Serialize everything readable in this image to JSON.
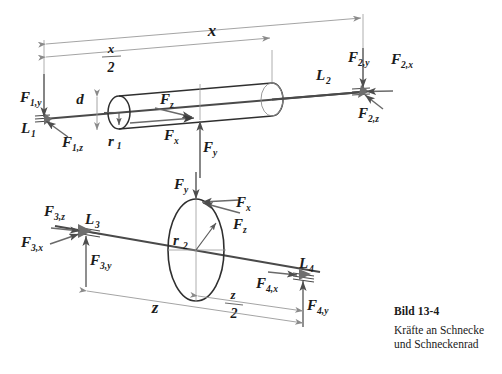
{
  "figure": {
    "caption_number": "Bild 13-4",
    "caption_line1": "Kräfte an Schnecke",
    "caption_line2": "und Schneckenrad",
    "stroke_color": "#555555",
    "outline_color": "#333333",
    "dim_color": "#8a8a8a",
    "text_color": "#1b1b1b",
    "background": "#ffffff"
  },
  "worm_shaft": {
    "name": "Schnecke",
    "dimensions": {
      "total_label": "x",
      "half_label_numerator": "x",
      "half_label_denominator": "2",
      "diameter_label": "d",
      "radius_label": "r",
      "radius_sub": "1"
    },
    "bearing_left": {
      "label": "L",
      "label_sub": "1",
      "forces": [
        {
          "label": "F",
          "sub": "1,y"
        },
        {
          "label": "F",
          "sub": "1,z"
        }
      ]
    },
    "bearing_right": {
      "label": "L",
      "label_sub": "2",
      "forces": [
        {
          "label": "F",
          "sub": "2,y"
        },
        {
          "label": "F",
          "sub": "2,x"
        },
        {
          "label": "F",
          "sub": "2,z"
        }
      ]
    },
    "mesh_forces": [
      {
        "label": "F",
        "sub": "z"
      },
      {
        "label": "F",
        "sub": "x"
      },
      {
        "label": "F",
        "sub": "y"
      }
    ]
  },
  "wheel_shaft": {
    "name": "Schneckenrad",
    "dimensions": {
      "total_label": "z",
      "half_label_numerator": "z",
      "half_label_denominator": "2",
      "radius_label": "r",
      "radius_sub": "2"
    },
    "bearing_left": {
      "label": "L",
      "label_sub": "3",
      "forces": [
        {
          "label": "F",
          "sub": "3,z"
        },
        {
          "label": "F",
          "sub": "3,x"
        },
        {
          "label": "F",
          "sub": "3,y"
        }
      ]
    },
    "bearing_right": {
      "label": "L",
      "label_sub": "4",
      "forces": [
        {
          "label": "F",
          "sub": "4,x"
        },
        {
          "label": "F",
          "sub": "4,y"
        }
      ]
    },
    "mesh_forces": [
      {
        "label": "F",
        "sub": "y"
      },
      {
        "label": "F",
        "sub": "x"
      },
      {
        "label": "F",
        "sub": "z"
      }
    ]
  }
}
